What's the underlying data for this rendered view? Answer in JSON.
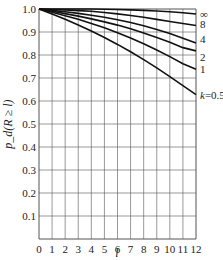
{
  "chart_data": {
    "type": "line",
    "title": "",
    "xlabel": "l",
    "ylabel": "p_d(R ≥ l)",
    "xlim": [
      0,
      12
    ],
    "ylim": [
      0,
      1.0
    ],
    "grid": true,
    "x_ticks": [
      "0",
      "1",
      "2",
      "3",
      "4",
      "5",
      "6",
      "7",
      "8",
      "9",
      "10",
      "11",
      "12"
    ],
    "y_ticks": [
      "0.1",
      "0.2",
      "0.3",
      "0.4",
      "0.5",
      "0.6",
      "0.7",
      "0.8",
      "0.9",
      "1.0"
    ],
    "x": [
      0,
      1,
      2,
      3,
      4,
      5,
      6,
      7,
      8,
      9,
      10,
      11,
      12
    ],
    "series": [
      {
        "name": "∞",
        "values": [
          1.0,
          1.0,
          1.0,
          1.0,
          1.0,
          0.999,
          0.998,
          0.996,
          0.994,
          0.991,
          0.988,
          0.984,
          0.978
        ]
      },
      {
        "name": "8",
        "values": [
          1.0,
          0.998,
          0.996,
          0.993,
          0.99,
          0.985,
          0.979,
          0.972,
          0.964,
          0.955,
          0.946,
          0.937,
          0.928
        ]
      },
      {
        "name": "4",
        "values": [
          1.0,
          0.994,
          0.988,
          0.981,
          0.973,
          0.964,
          0.953,
          0.941,
          0.927,
          0.911,
          0.893,
          0.873,
          0.852
        ]
      },
      {
        "name": "2",
        "values": [
          1.0,
          0.99,
          0.98,
          0.969,
          0.957,
          0.944,
          0.93,
          0.914,
          0.896,
          0.876,
          0.855,
          0.832,
          0.818
        ]
      },
      {
        "name": "1",
        "values": [
          1.0,
          0.986,
          0.971,
          0.955,
          0.937,
          0.918,
          0.897,
          0.874,
          0.849,
          0.822,
          0.793,
          0.762,
          0.738
        ]
      },
      {
        "name": "k=0.5",
        "values": [
          1.0,
          0.978,
          0.955,
          0.93,
          0.904,
          0.876,
          0.846,
          0.814,
          0.78,
          0.744,
          0.706,
          0.667,
          0.628
        ]
      }
    ],
    "legend_position": "right, inline curve labels"
  }
}
